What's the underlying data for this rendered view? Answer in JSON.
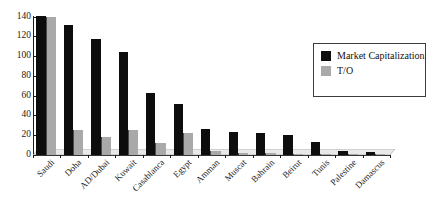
{
  "chart_data": {
    "type": "bar",
    "title": "",
    "xlabel": "",
    "ylabel": "",
    "ylim": [
      0,
      140
    ],
    "yticks": [
      0,
      20,
      40,
      60,
      80,
      100,
      120,
      140
    ],
    "grid": false,
    "legend_position": "upper-right",
    "categories": [
      "Saudi",
      "Doha",
      "AD/Dubai",
      "Kuwait",
      "Casablanca",
      "Egypt",
      "Amman",
      "Muscat",
      "Bahrain",
      "Beirut",
      "Tunis",
      "Palestine",
      "Damascus"
    ],
    "series": [
      {
        "name": "Market Capitalization",
        "color": "#0d0d0d",
        "values": [
          141,
          131,
          117,
          104,
          63,
          52,
          26,
          23,
          22,
          20,
          13,
          4,
          3
        ]
      },
      {
        "name": "T/O",
        "color": "#a9a9a9",
        "values": [
          140,
          25,
          18,
          25,
          12,
          22,
          4,
          2,
          2,
          1.5,
          1,
          0.5,
          0.5
        ]
      }
    ]
  },
  "legend": {
    "entries": [
      {
        "label": "Market Capitalization",
        "color": "#0d0d0d"
      },
      {
        "label": "T/O",
        "color": "#a9a9a9"
      }
    ]
  }
}
